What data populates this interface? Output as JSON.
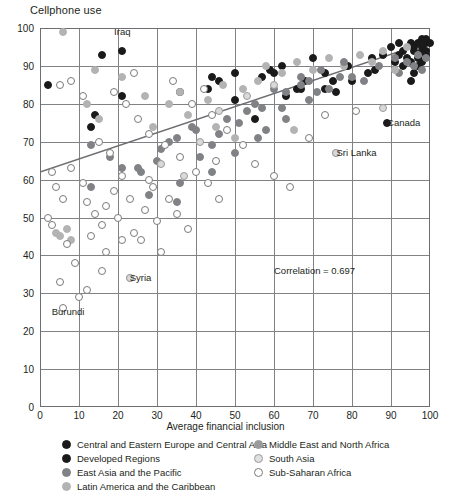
{
  "chart_data": {
    "type": "scatter",
    "title": "",
    "ylabel": "Cellphone use",
    "xlabel": "Average financial inclusion",
    "xlim": [
      0,
      100
    ],
    "ylim": [
      0,
      100
    ],
    "xticks": [
      0,
      10,
      20,
      30,
      40,
      50,
      60,
      70,
      80,
      90,
      100
    ],
    "yticks": [
      0,
      10,
      20,
      30,
      40,
      50,
      60,
      70,
      80,
      90,
      100
    ],
    "grid": true,
    "legend_position": "bottom",
    "annotations": [
      {
        "text": "Iraq",
        "x": 19,
        "y": 99
      },
      {
        "text": "Syria",
        "x": 23,
        "y": 34
      },
      {
        "text": "Burundi",
        "x": 3,
        "y": 25
      },
      {
        "text": "Canada",
        "x": 89,
        "y": 75
      },
      {
        "text": "Sri Lanka",
        "x": 76,
        "y": 67
      },
      {
        "text": "Correlation = 0.697",
        "x": 60,
        "y": 36
      }
    ],
    "trendline": {
      "x0": 0,
      "y0": 62,
      "x1": 100,
      "y1": 96.5,
      "color": "#6d6e71"
    },
    "series": [
      {
        "name": "Central and Eastern Europe and Central Asia",
        "color": "#1a1a1a",
        "marker": "filled-circle",
        "points": [
          [
            2,
            85
          ],
          [
            16,
            93
          ],
          [
            21,
            94
          ],
          [
            21,
            82
          ],
          [
            14,
            77
          ],
          [
            13,
            74
          ],
          [
            36,
            83
          ],
          [
            50,
            88
          ],
          [
            50,
            81
          ],
          [
            57,
            87
          ],
          [
            62,
            90
          ],
          [
            63,
            82
          ],
          [
            55,
            76
          ],
          [
            70,
            92
          ],
          [
            73,
            88
          ],
          [
            75,
            86
          ],
          [
            73,
            84
          ],
          [
            79,
            90
          ],
          [
            85,
            92
          ],
          [
            86,
            89
          ],
          [
            88,
            93
          ],
          [
            90,
            95
          ],
          [
            92,
            93
          ],
          [
            93,
            94
          ],
          [
            95,
            96
          ],
          [
            96,
            95
          ],
          [
            97,
            92
          ],
          [
            98,
            97
          ],
          [
            98,
            94
          ],
          [
            99,
            96
          ],
          [
            68,
            86
          ],
          [
            67,
            84
          ],
          [
            66,
            84
          ],
          [
            80,
            86
          ],
          [
            76,
            83
          ],
          [
            84,
            88
          ],
          [
            44,
            87
          ],
          [
            46,
            86
          ],
          [
            59,
            89
          ],
          [
            60,
            88
          ],
          [
            43,
            84
          ]
        ]
      },
      {
        "name": "Developed Regions",
        "color": "#1a1a1a",
        "marker": "filled-circle",
        "points": [
          [
            94,
            92
          ],
          [
            95,
            91
          ],
          [
            96,
            94
          ],
          [
            97,
            96
          ],
          [
            98,
            95
          ],
          [
            99,
            97
          ],
          [
            99,
            93
          ],
          [
            97,
            90
          ],
          [
            96,
            88
          ],
          [
            95,
            86
          ],
          [
            98,
            91
          ],
          [
            99,
            94
          ],
          [
            100,
            96
          ],
          [
            93,
            90
          ],
          [
            92,
            96
          ],
          [
            91,
            91
          ],
          [
            89,
            75
          ]
        ]
      },
      {
        "name": "East Asia and the Pacific",
        "color": "#808285",
        "marker": "filled-circle",
        "points": [
          [
            13,
            69
          ],
          [
            18,
            66
          ],
          [
            21,
            63
          ],
          [
            26,
            62
          ],
          [
            33,
            70
          ],
          [
            39,
            74
          ],
          [
            41,
            66
          ],
          [
            46,
            72
          ],
          [
            53,
            78
          ],
          [
            58,
            73
          ],
          [
            62,
            79
          ],
          [
            67,
            85
          ],
          [
            71,
            83
          ],
          [
            77,
            87
          ],
          [
            83,
            86
          ],
          [
            87,
            90
          ],
          [
            91,
            92
          ],
          [
            94,
            91
          ],
          [
            28,
            56
          ],
          [
            35,
            54
          ],
          [
            36,
            59
          ],
          [
            44,
            62
          ],
          [
            50,
            67
          ],
          [
            56,
            71
          ],
          [
            63,
            76
          ],
          [
            69,
            81
          ],
          [
            74,
            84
          ],
          [
            80,
            87
          ],
          [
            97,
            93
          ],
          [
            98,
            89
          ],
          [
            99,
            92
          ],
          [
            96,
            90
          ],
          [
            92,
            88
          ]
        ]
      },
      {
        "name": "Latin America and the Caribbean",
        "color": "#b3b3b3",
        "marker": "filled-circle",
        "points": [
          [
            6,
            99
          ],
          [
            14,
            89
          ],
          [
            21,
            87
          ],
          [
            12,
            80
          ],
          [
            15,
            76
          ],
          [
            27,
            82
          ],
          [
            33,
            80
          ],
          [
            36,
            83
          ],
          [
            43,
            81
          ],
          [
            47,
            85
          ],
          [
            52,
            84
          ],
          [
            56,
            86
          ],
          [
            58,
            90
          ],
          [
            62,
            88
          ],
          [
            66,
            91
          ],
          [
            70,
            89
          ],
          [
            74,
            92
          ],
          [
            78,
            90
          ],
          [
            82,
            93
          ],
          [
            85,
            91
          ],
          [
            88,
            94
          ],
          [
            91,
            89
          ],
          [
            94,
            95
          ],
          [
            23,
            34
          ],
          [
            29,
            74
          ],
          [
            38,
            77
          ],
          [
            45,
            74
          ],
          [
            50,
            71
          ],
          [
            65,
            73
          ],
          [
            76,
            67
          ],
          [
            4,
            46
          ],
          [
            5,
            45
          ],
          [
            8,
            44
          ],
          [
            7,
            47
          ]
        ]
      },
      {
        "name": "Middle East and North Africa",
        "color": "#808285",
        "marker": "filled-circle",
        "points": [
          [
            13,
            58
          ],
          [
            25,
            63
          ],
          [
            31,
            68
          ],
          [
            40,
            73
          ],
          [
            48,
            76
          ],
          [
            55,
            80
          ],
          [
            60,
            84
          ],
          [
            67,
            87
          ],
          [
            72,
            89
          ],
          [
            78,
            91
          ],
          [
            30,
            65
          ],
          [
            35,
            71
          ],
          [
            44,
            69
          ],
          [
            51,
            75
          ],
          [
            57,
            79
          ],
          [
            63,
            83
          ],
          [
            69,
            86
          ]
        ]
      },
      {
        "name": "South Asia",
        "color": "#d9d9d9",
        "marker": "outlined-light-circle",
        "points": [
          [
            31,
            64
          ],
          [
            37,
            61
          ],
          [
            41,
            70
          ],
          [
            46,
            78
          ],
          [
            53,
            82
          ],
          [
            60,
            85
          ],
          [
            76,
            67
          ],
          [
            23,
            34
          ],
          [
            88,
            79
          ]
        ]
      },
      {
        "name": "Sub-Saharan Africa",
        "color": "#ffffff",
        "marker": "open-circle",
        "points": [
          [
            5,
            85
          ],
          [
            3,
            62
          ],
          [
            4,
            58
          ],
          [
            6,
            55
          ],
          [
            2,
            50
          ],
          [
            3,
            48
          ],
          [
            7,
            43
          ],
          [
            9,
            38
          ],
          [
            5,
            33
          ],
          [
            10,
            29
          ],
          [
            8,
            63
          ],
          [
            11,
            59
          ],
          [
            12,
            54
          ],
          [
            14,
            51
          ],
          [
            16,
            48
          ],
          [
            13,
            45
          ],
          [
            17,
            41
          ],
          [
            19,
            57
          ],
          [
            21,
            61
          ],
          [
            23,
            55
          ],
          [
            20,
            50
          ],
          [
            24,
            46
          ],
          [
            27,
            52
          ],
          [
            29,
            58
          ],
          [
            26,
            44
          ],
          [
            30,
            49
          ],
          [
            33,
            55
          ],
          [
            35,
            51
          ],
          [
            38,
            47
          ],
          [
            31,
            41
          ],
          [
            19,
            83
          ],
          [
            22,
            80
          ],
          [
            25,
            76
          ],
          [
            28,
            72
          ],
          [
            32,
            69
          ],
          [
            36,
            66
          ],
          [
            40,
            62
          ],
          [
            43,
            59
          ],
          [
            46,
            55
          ],
          [
            34,
            86
          ],
          [
            39,
            80
          ],
          [
            44,
            77
          ],
          [
            48,
            73
          ],
          [
            52,
            69
          ],
          [
            55,
            64
          ],
          [
            60,
            61
          ],
          [
            64,
            58
          ],
          [
            69,
            71
          ],
          [
            73,
            77
          ],
          [
            8,
            86
          ],
          [
            11,
            82
          ],
          [
            15,
            70
          ],
          [
            18,
            67
          ],
          [
            24,
            88
          ],
          [
            42,
            84
          ],
          [
            6,
            26
          ],
          [
            12,
            31
          ],
          [
            16,
            36
          ],
          [
            21,
            44
          ],
          [
            81,
            78
          ],
          [
            17,
            53
          ],
          [
            28,
            60
          ],
          [
            45,
            65
          ]
        ]
      }
    ]
  },
  "legend": {
    "left_column": [
      {
        "label": "Central and Eastern Europe and Central Asia",
        "color": "#1a1a1a",
        "style": "filled"
      },
      {
        "label": "Developed Regions",
        "color": "#1a1a1a",
        "style": "filled"
      },
      {
        "label": "East Asia and the Pacific",
        "color": "#808285",
        "style": "filled"
      },
      {
        "label": "Latin America and the Caribbean",
        "color": "#b3b3b3",
        "style": "filled"
      }
    ],
    "right_column": [
      {
        "label": "Middle East and North Africa",
        "color": "#9a9a9a",
        "style": "filled"
      },
      {
        "label": "South Asia",
        "color": "#e0e0e0",
        "style": "outlined"
      },
      {
        "label": "Sub-Saharan Africa",
        "color": "#ffffff",
        "style": "open"
      }
    ]
  }
}
